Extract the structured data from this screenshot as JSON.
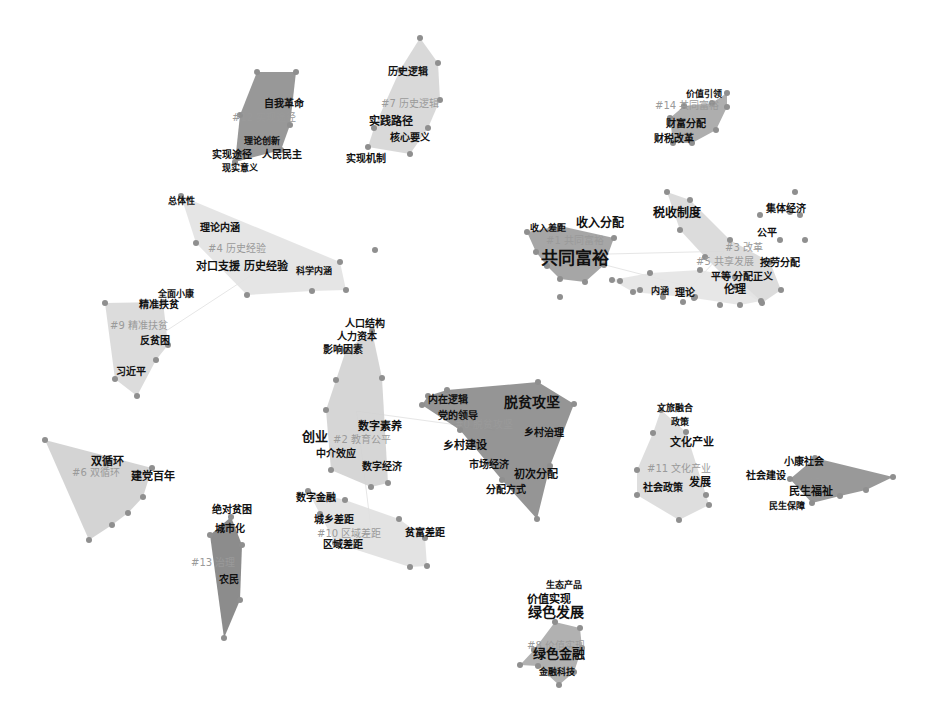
{
  "diagram": {
    "type": "keyword-cluster-map",
    "background": "#ffffff",
    "clusters": [
      {
        "id": "#0",
        "label": "#0 脱贫攻坚",
        "color": "#8a8a8a",
        "hull": [
          [
            428,
            396
          ],
          [
            447,
            390
          ],
          [
            538,
            382
          ],
          [
            574,
            404
          ],
          [
            550,
            466
          ],
          [
            537,
            519
          ],
          [
            502,
            480
          ],
          [
            460,
            430
          ],
          [
            422,
            405
          ]
        ],
        "label_pos": [
          455,
          422
        ],
        "keywords": [
          {
            "text": "内在逻辑",
            "x": 428,
            "y": 396,
            "size": 10
          },
          {
            "text": "党的领导",
            "x": 438,
            "y": 412,
            "size": 10
          },
          {
            "text": "脱贫攻坚",
            "x": 504,
            "y": 398,
            "size": 14
          },
          {
            "text": "乡村治理",
            "x": 524,
            "y": 429,
            "size": 10
          },
          {
            "text": "乡村建设",
            "x": 443,
            "y": 441,
            "size": 11
          },
          {
            "text": "市场经济",
            "x": 469,
            "y": 461,
            "size": 10
          },
          {
            "text": "初次分配",
            "x": 514,
            "y": 470,
            "size": 11
          },
          {
            "text": "分配方式",
            "x": 486,
            "y": 486,
            "size": 10
          }
        ]
      },
      {
        "id": "#1",
        "label": "#1 共同富裕",
        "color": "#9c9c9c",
        "hull": [
          [
            527,
            232
          ],
          [
            560,
            226
          ],
          [
            614,
            238
          ],
          [
            604,
            265
          ],
          [
            585,
            282
          ],
          [
            560,
            279
          ],
          [
            547,
            266
          ],
          [
            536,
            252
          ]
        ],
        "label_pos": [
          546,
          238
        ],
        "keywords": [
          {
            "text": "收入差距",
            "x": 530,
            "y": 225,
            "size": 9
          },
          {
            "text": "收入分配",
            "x": 576,
            "y": 219,
            "size": 12
          },
          {
            "text": "共同富裕",
            "x": 541,
            "y": 252,
            "size": 17
          }
        ]
      },
      {
        "id": "#2",
        "label": "#2 教育公平",
        "color": "#d2d2d2",
        "hull": [
          [
            372,
            331
          ],
          [
            382,
            378
          ],
          [
            388,
            483
          ],
          [
            371,
            487
          ],
          [
            331,
            470
          ],
          [
            326,
            410
          ],
          [
            336,
            380
          ],
          [
            346,
            350
          ]
        ],
        "label_pos": [
          333,
          437
        ],
        "keywords": [
          {
            "text": "人口结构",
            "x": 345,
            "y": 320,
            "size": 10
          },
          {
            "text": "人力资本",
            "x": 337,
            "y": 333,
            "size": 10
          },
          {
            "text": "影响因素",
            "x": 323,
            "y": 346,
            "size": 10
          },
          {
            "text": "数字素养",
            "x": 358,
            "y": 422,
            "size": 11
          },
          {
            "text": "创业",
            "x": 302,
            "y": 432,
            "size": 13
          },
          {
            "text": "中介效应",
            "x": 316,
            "y": 450,
            "size": 10
          },
          {
            "text": "数字经济",
            "x": 362,
            "y": 463,
            "size": 10
          }
        ]
      },
      {
        "id": "#3",
        "label": "#3 改革",
        "color": "#d8d8d8",
        "hull": [
          [
            667,
            192
          ],
          [
            690,
            200
          ],
          [
            730,
            240
          ],
          [
            770,
            262
          ],
          [
            781,
            290
          ],
          [
            762,
            303
          ],
          [
            735,
            287
          ],
          [
            705,
            257
          ],
          [
            680,
            230
          ]
        ],
        "label_pos": [
          725,
          245
        ],
        "keywords": [
          {
            "text": "税收制度",
            "x": 653,
            "y": 209,
            "size": 12
          },
          {
            "text": "集体经济",
            "x": 766,
            "y": 205,
            "size": 10
          },
          {
            "text": "公平",
            "x": 757,
            "y": 229,
            "size": 10
          }
        ]
      },
      {
        "id": "#4",
        "label": "#4 历史经验",
        "color": "#e2e2e2",
        "hull": [
          [
            181,
            196
          ],
          [
            340,
            262
          ],
          [
            346,
            290
          ],
          [
            312,
            291
          ],
          [
            247,
            295
          ],
          [
            196,
            243
          ]
        ],
        "label_pos": [
          208,
          246
        ],
        "keywords": [
          {
            "text": "总体性",
            "x": 168,
            "y": 198,
            "size": 9
          },
          {
            "text": "理论内涵",
            "x": 200,
            "y": 224,
            "size": 10
          },
          {
            "text": "对口支援",
            "x": 196,
            "y": 262,
            "size": 11
          },
          {
            "text": "历史经验",
            "x": 244,
            "y": 262,
            "size": 11
          },
          {
            "text": "科学内涵",
            "x": 296,
            "y": 268,
            "size": 9
          }
        ]
      },
      {
        "id": "#5",
        "label": "#5 共享发展",
        "color": "#e4e4e4",
        "hull": [
          [
            612,
            280
          ],
          [
            650,
            273
          ],
          [
            700,
            270
          ],
          [
            735,
            277
          ],
          [
            761,
            301
          ],
          [
            740,
            305
          ],
          [
            694,
            298
          ],
          [
            633,
            292
          ]
        ],
        "label_pos": [
          696,
          259
        ],
        "keywords": [
          {
            "text": "按劳分配",
            "x": 760,
            "y": 259,
            "size": 10
          },
          {
            "text": "平等",
            "x": 711,
            "y": 273,
            "size": 10
          },
          {
            "text": "分配正义",
            "x": 733,
            "y": 273,
            "size": 10
          },
          {
            "text": "伦理",
            "x": 724,
            "y": 285,
            "size": 11
          },
          {
            "text": "内涵",
            "x": 651,
            "y": 288,
            "size": 9
          },
          {
            "text": "理论",
            "x": 675,
            "y": 289,
            "size": 10
          }
        ]
      },
      {
        "id": "#6",
        "label": "#6 双循环",
        "color": "#cfcfcf",
        "hull": [
          [
            45,
            440
          ],
          [
            152,
            468
          ],
          [
            143,
            497
          ],
          [
            128,
            513
          ],
          [
            112,
            525
          ],
          [
            89,
            540
          ]
        ],
        "label_pos": [
          72,
          470
        ],
        "keywords": [
          {
            "text": "双循环",
            "x": 91,
            "y": 457,
            "size": 11
          },
          {
            "text": "建党百年",
            "x": 131,
            "y": 472,
            "size": 11
          }
        ]
      },
      {
        "id": "#7",
        "label": "#7 历史逻辑",
        "color": "#d5d5d5",
        "hull": [
          [
            420,
            38
          ],
          [
            438,
            63
          ],
          [
            440,
            100
          ],
          [
            428,
            128
          ],
          [
            410,
            154
          ],
          [
            368,
            147
          ],
          [
            374,
            128
          ],
          [
            400,
            70
          ]
        ],
        "label_pos": [
          381,
          101
        ],
        "keywords": [
          {
            "text": "历史逻辑",
            "x": 388,
            "y": 68,
            "size": 10
          },
          {
            "text": "实践路径",
            "x": 369,
            "y": 117,
            "size": 11
          },
          {
            "text": "核心要义",
            "x": 390,
            "y": 134,
            "size": 10
          },
          {
            "text": "实现机制",
            "x": 346,
            "y": 155,
            "size": 10
          }
        ]
      },
      {
        "id": "#8",
        "label": "#8 价值实现",
        "color": "#a8a8a8",
        "hull": [
          [
            555,
            622
          ],
          [
            580,
            628
          ],
          [
            582,
            648
          ],
          [
            574,
            672
          ],
          [
            559,
            685
          ],
          [
            538,
            666
          ],
          [
            520,
            665
          ],
          [
            534,
            650
          ]
        ],
        "label_pos": [
          527,
          643
        ],
        "keywords": [
          {
            "text": "生态产品",
            "x": 546,
            "y": 582,
            "size": 9
          },
          {
            "text": "价值实现",
            "x": 527,
            "y": 595,
            "size": 11
          },
          {
            "text": "绿色发展",
            "x": 528,
            "y": 608,
            "size": 14
          },
          {
            "text": "绿色金融",
            "x": 533,
            "y": 649,
            "size": 13
          },
          {
            "text": "金融科技",
            "x": 539,
            "y": 669,
            "size": 9
          }
        ]
      },
      {
        "id": "#9",
        "label": "#9 精准扶贫",
        "color": "#d8d8d8",
        "hull": [
          [
            105,
            303
          ],
          [
            163,
            302
          ],
          [
            168,
            345
          ],
          [
            156,
            360
          ],
          [
            137,
            396
          ],
          [
            115,
            379
          ]
        ],
        "label_pos": [
          110,
          323
        ],
        "keywords": [
          {
            "text": "全面小康",
            "x": 158,
            "y": 291,
            "size": 9
          },
          {
            "text": "精准扶贫",
            "x": 139,
            "y": 301,
            "size": 10
          },
          {
            "text": "反贫困",
            "x": 140,
            "y": 337,
            "size": 10
          },
          {
            "text": "习近平",
            "x": 116,
            "y": 368,
            "size": 10
          }
        ]
      },
      {
        "id": "#10",
        "label": "#10 区域差距",
        "color": "#e0e0e0",
        "hull": [
          [
            308,
            491
          ],
          [
            345,
            500
          ],
          [
            399,
            519
          ],
          [
            425,
            538
          ],
          [
            427,
            566
          ],
          [
            410,
            567
          ],
          [
            335,
            543
          ],
          [
            320,
            514
          ]
        ],
        "label_pos": [
          317,
          531
        ],
        "keywords": [
          {
            "text": "数字金融",
            "x": 296,
            "y": 494,
            "size": 10
          },
          {
            "text": "城乡差距",
            "x": 314,
            "y": 516,
            "size": 10
          },
          {
            "text": "贫富差距",
            "x": 405,
            "y": 529,
            "size": 10
          },
          {
            "text": "区域差距",
            "x": 323,
            "y": 541,
            "size": 10
          }
        ]
      },
      {
        "id": "#11",
        "label": "#11 文化产业",
        "color": "#dadada",
        "hull": [
          [
            661,
            410
          ],
          [
            686,
            432
          ],
          [
            706,
            495
          ],
          [
            709,
            505
          ],
          [
            679,
            520
          ],
          [
            637,
            495
          ],
          [
            637,
            470
          ],
          [
            653,
            433
          ]
        ],
        "label_pos": [
          647,
          466
        ],
        "keywords": [
          {
            "text": "文旅融合",
            "x": 657,
            "y": 405,
            "size": 9
          },
          {
            "text": "政策",
            "x": 671,
            "y": 419,
            "size": 9
          },
          {
            "text": "文化产业",
            "x": 670,
            "y": 438,
            "size": 11
          },
          {
            "text": "社会政策",
            "x": 643,
            "y": 484,
            "size": 10
          },
          {
            "text": "发展",
            "x": 689,
            "y": 478,
            "size": 11
          }
        ]
      },
      {
        "id": "#12",
        "label": "#12 实现途径",
        "color": "#8d8d8d",
        "hull": [
          [
            257,
            72
          ],
          [
            296,
            72
          ],
          [
            290,
            125
          ],
          [
            281,
            150
          ],
          [
            235,
            162
          ],
          [
            240,
            115
          ]
        ],
        "label_pos": [
          232,
          115
        ],
        "keywords": [
          {
            "text": "自我革命",
            "x": 264,
            "y": 100,
            "size": 10
          },
          {
            "text": "理论创新",
            "x": 244,
            "y": 138,
            "size": 9
          },
          {
            "text": "实现途径",
            "x": 212,
            "y": 151,
            "size": 10
          },
          {
            "text": "人民民主",
            "x": 262,
            "y": 151,
            "size": 10
          },
          {
            "text": "现实意义",
            "x": 222,
            "y": 165,
            "size": 9
          }
        ]
      },
      {
        "id": "#13",
        "label": "#13 治理",
        "color": "#7f7f7f",
        "hull": [
          [
            231,
            517
          ],
          [
            242,
            545
          ],
          [
            240,
            600
          ],
          [
            224,
            638
          ],
          [
            210,
            535
          ]
        ],
        "label_pos": [
          191,
          560
        ],
        "keywords": [
          {
            "text": "绝对贫困",
            "x": 212,
            "y": 506,
            "size": 10
          },
          {
            "text": "城市化",
            "x": 215,
            "y": 525,
            "size": 10
          },
          {
            "text": "农民",
            "x": 219,
            "y": 576,
            "size": 10
          }
        ]
      },
      {
        "id": "#14",
        "label": "#14 共同富裕",
        "color": "#a5a5a5",
        "hull": [
          [
            712,
            103
          ],
          [
            727,
            93
          ],
          [
            727,
            107
          ],
          [
            716,
            130
          ],
          [
            692,
            143
          ],
          [
            673,
            143
          ],
          [
            670,
            118
          ],
          [
            684,
            106
          ]
        ],
        "label_pos": [
          655,
          103
        ],
        "keywords": [
          {
            "text": "价值引领",
            "x": 686,
            "y": 91,
            "size": 9
          },
          {
            "text": "财富分配",
            "x": 666,
            "y": 120,
            "size": 10
          },
          {
            "text": "财税改革",
            "x": 654,
            "y": 135,
            "size": 10
          }
        ]
      },
      {
        "id": "#15",
        "label": "#15 民生福祉",
        "color": "#8e8e8e",
        "hull": [
          [
            815,
            458
          ],
          [
            893,
            477
          ],
          [
            866,
            490
          ],
          [
            840,
            496
          ],
          [
            812,
            503
          ],
          [
            790,
            479
          ]
        ],
        "label_pos": [
          800,
          480
        ],
        "keywords": [
          {
            "text": "小康社会",
            "x": 784,
            "y": 458,
            "size": 10
          },
          {
            "text": "社会建设",
            "x": 746,
            "y": 472,
            "size": 10
          },
          {
            "text": "民生福祉",
            "x": 789,
            "y": 487,
            "size": 11
          },
          {
            "text": "民生保障",
            "x": 769,
            "y": 503,
            "size": 9
          }
        ]
      }
    ],
    "extra_nodes": [
      [
        795,
        192
      ],
      [
        790,
        212
      ],
      [
        800,
        215
      ],
      [
        780,
        240
      ],
      [
        805,
        240
      ],
      [
        760,
        215
      ],
      [
        620,
        281
      ],
      [
        640,
        290
      ],
      [
        663,
        297
      ],
      [
        683,
        302
      ],
      [
        720,
        305
      ],
      [
        375,
        250
      ],
      [
        560,
        297
      ],
      [
        695,
        297
      ]
    ]
  }
}
